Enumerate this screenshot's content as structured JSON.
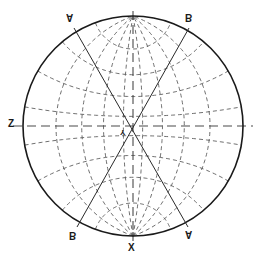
{
  "figure": {
    "type": "wulff-net",
    "background_color": "#ffffff",
    "outline_color": "#1a1a1a",
    "grid_color": "#4a4a4a",
    "trace_color": "#2a2a2a",
    "width": 256,
    "height": 262
  },
  "circle": {
    "center_x": 133,
    "center_y": 126,
    "radius": 110,
    "stroke_width": 1.6
  },
  "grid": {
    "meridian_step_deg": 20,
    "parallel_step_deg": 20,
    "dash_pattern": "4 3",
    "stroke_width": 0.8,
    "axes_dash_pattern": "9 5"
  },
  "traces": [
    {
      "name": "trace-a",
      "from": {
        "x": 74,
        "y": 28
      },
      "to": {
        "x": 188,
        "y": 227
      },
      "start_label": "A",
      "end_label": "A"
    },
    {
      "name": "trace-b",
      "from": {
        "x": 189,
        "y": 28
      },
      "to": {
        "x": 77,
        "y": 227
      },
      "start_label": "B",
      "end_label": "B"
    }
  ],
  "labels": {
    "top_left": {
      "text": "A",
      "x": 66,
      "y": 12
    },
    "top_right": {
      "text": "B",
      "x": 185,
      "y": 12
    },
    "left": {
      "text": "Z",
      "x": 8,
      "y": 119
    },
    "center": {
      "text": "Y",
      "x": 120,
      "y": 128
    },
    "bottom_left": {
      "text": "B",
      "x": 69,
      "y": 230
    },
    "bottom_right": {
      "text": "A",
      "x": 185,
      "y": 229
    },
    "bottom_center": {
      "text": "X",
      "x": 128,
      "y": 243
    }
  }
}
